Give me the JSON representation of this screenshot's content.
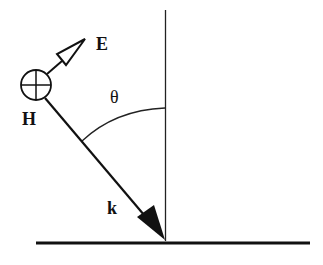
{
  "diagram": {
    "labels": {
      "E": "E",
      "H": "H",
      "theta": "θ",
      "k": "k"
    },
    "colors": {
      "stroke": "#111111",
      "background": "#ffffff"
    }
  }
}
